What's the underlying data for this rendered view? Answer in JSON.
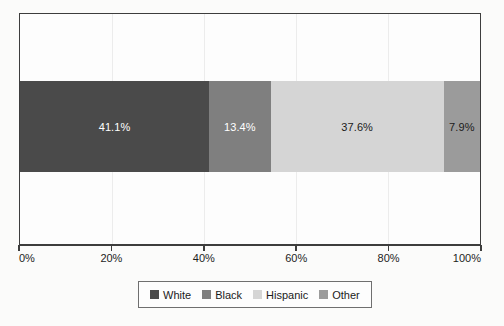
{
  "chart_data": {
    "type": "bar",
    "orientation": "horizontal",
    "stacked": true,
    "title": "",
    "subtitle": "",
    "xlabel": "",
    "ylabel": "",
    "categories": [
      ""
    ],
    "series": [
      {
        "name": "White",
        "values": [
          41.1
        ],
        "label": "41.1%",
        "color": "#4a4a4a",
        "text_color": "#ffffff"
      },
      {
        "name": "Black",
        "values": [
          13.4
        ],
        "label": "13.4%",
        "color": "#7f7f7f",
        "text_color": "#ffffff"
      },
      {
        "name": "Hispanic",
        "values": [
          37.6
        ],
        "label": "37.6%",
        "color": "#d5d5d5",
        "text_color": "#1b1b1b"
      },
      {
        "name": "Other",
        "values": [
          7.9
        ],
        "label": "7.9%",
        "color": "#9b9b9b",
        "text_color": "#1b1b1b"
      }
    ],
    "xlim": [
      0,
      100
    ],
    "xticks": [
      0,
      20,
      40,
      60,
      80,
      100
    ],
    "xticklabels": [
      "0%",
      "20%",
      "40%",
      "60%",
      "80%",
      "100%"
    ],
    "grid": "vertical",
    "legend_position": "bottom",
    "legend_entries": [
      "White",
      "Black",
      "Hispanic",
      "Other"
    ],
    "annotations": [
      "41.1%",
      "13.4%",
      "37.6%",
      "7.9%"
    ]
  },
  "axis": {
    "tick_labels": [
      "0%",
      "20%",
      "40%",
      "60%",
      "80%",
      "100%"
    ]
  },
  "legend": {
    "items": [
      {
        "label": "White"
      },
      {
        "label": "Black"
      },
      {
        "label": "Hispanic"
      },
      {
        "label": "Other"
      }
    ]
  },
  "colors": {
    "frame": "#3d3d3d",
    "plot_background": "#fdfdfd",
    "page_background": "#fbfbfa",
    "gridline": "#ececec",
    "legend_border": "#6f6f6f"
  }
}
